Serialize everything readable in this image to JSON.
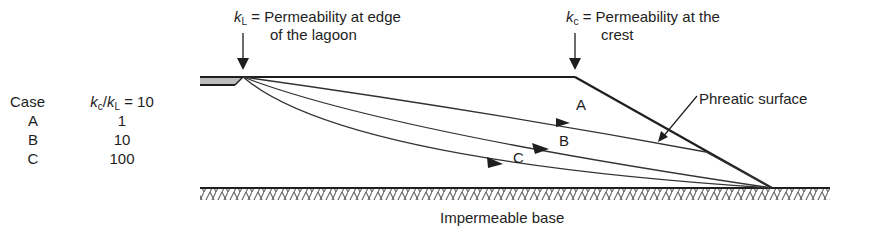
{
  "figure": {
    "labels": {
      "kL_symbol": "k",
      "kL_sub": "L",
      "kL_text": " = Permeability at edge",
      "kL_text2": "of the lagoon",
      "kc_symbol": "k",
      "kc_sub": "c",
      "kc_text": " = Permeability at the",
      "kc_text2": "crest",
      "phreatic": "Phreatic surface",
      "base": "Impermeable base",
      "curve_A": "A",
      "curve_B": "B",
      "curve_C": "C"
    },
    "table": {
      "header_case": "Case",
      "header_ratio_k1": "k",
      "header_ratio_sub1": "c",
      "header_ratio_slash": "/",
      "header_ratio_k2": "k",
      "header_ratio_sub2": "L",
      "header_ratio_eq": " = 10",
      "rows": [
        {
          "case": "A",
          "value": "1"
        },
        {
          "case": "B",
          "value": "10"
        },
        {
          "case": "C",
          "value": "100"
        }
      ]
    },
    "colors": {
      "line": "#1e1e1e",
      "hatch": "#555555",
      "lagoon_fill": "#bdbdbd"
    }
  }
}
